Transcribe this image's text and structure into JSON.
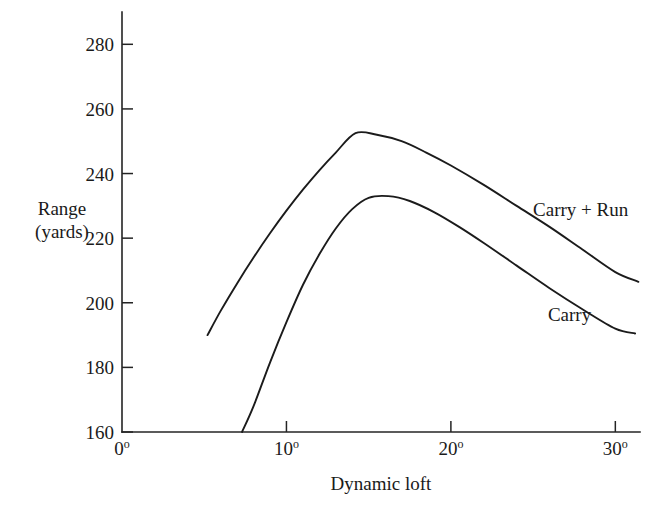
{
  "chart_data": {
    "type": "line",
    "title": "",
    "xlabel": "Dynamic loft",
    "ylabel_line1": "Range",
    "ylabel_line2": "(yards)",
    "xlim": [
      0,
      31.5
    ],
    "ylim": [
      160,
      290
    ],
    "xticks": [
      0,
      10,
      20,
      30
    ],
    "xtick_labels": [
      "0",
      "10",
      "20",
      "30"
    ],
    "xtick_suffix": "o",
    "yticks": [
      160,
      180,
      200,
      220,
      240,
      260,
      280
    ],
    "ytick_labels": [
      "160",
      "180",
      "200",
      "220",
      "240",
      "260",
      "280"
    ],
    "grid": false,
    "legend_position": "inline-right",
    "series": [
      {
        "name": "Carry + Run",
        "label_x": 25.0,
        "label_y": 227.0,
        "x": [
          5.2,
          6.0,
          7.0,
          8.0,
          9.0,
          10.0,
          11.0,
          12.0,
          13.0,
          14.2,
          15.5,
          17.0,
          18.5,
          20.0,
          22.0,
          24.0,
          26.0,
          28.0,
          30.0,
          31.4
        ],
        "y": [
          190.0,
          197.5,
          206.0,
          214.0,
          221.5,
          228.5,
          235.0,
          241.0,
          246.5,
          252.5,
          252.0,
          250.0,
          246.5,
          242.5,
          236.5,
          230.0,
          223.5,
          216.5,
          209.5,
          206.5
        ]
      },
      {
        "name": "Carry",
        "label_x": 25.9,
        "label_y": 194.5,
        "x": [
          7.3,
          8.0,
          9.0,
          10.0,
          11.0,
          12.0,
          13.0,
          14.0,
          15.0,
          16.2,
          17.5,
          19.0,
          20.5,
          22.0,
          24.0,
          26.0,
          28.0,
          30.0,
          31.2
        ],
        "y": [
          160.0,
          168.0,
          181.5,
          194.0,
          205.5,
          215.0,
          223.0,
          229.0,
          232.5,
          233.0,
          231.5,
          228.0,
          223.5,
          218.5,
          211.5,
          204.5,
          198.0,
          192.0,
          190.5
        ]
      }
    ]
  },
  "colors": {
    "axis": "#242424",
    "curve": "#1b1b1b",
    "text": "#1a1a1a",
    "background": "#ffffff"
  }
}
